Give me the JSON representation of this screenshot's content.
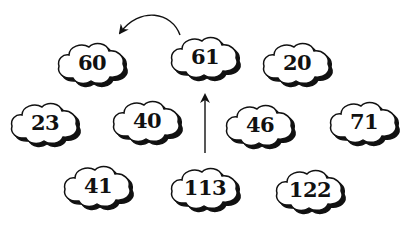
{
  "diagram": {
    "type": "number-clouds",
    "colors": {
      "background": "#ffffff",
      "outline": "#111111",
      "shadow": "#111111",
      "fill": "#ffffff",
      "text": "#111111"
    },
    "clouds": [
      {
        "id": "c60",
        "label": "60",
        "cx": 92,
        "cy": 63
      },
      {
        "id": "c61",
        "label": "61",
        "cx": 205,
        "cy": 57
      },
      {
        "id": "c20",
        "label": "20",
        "cx": 297,
        "cy": 63
      },
      {
        "id": "c23",
        "label": "23",
        "cx": 45,
        "cy": 123
      },
      {
        "id": "c40",
        "label": "40",
        "cx": 147,
        "cy": 121
      },
      {
        "id": "c46",
        "label": "46",
        "cx": 260,
        "cy": 125
      },
      {
        "id": "c71",
        "label": "71",
        "cx": 364,
        "cy": 122
      },
      {
        "id": "c41",
        "label": "41",
        "cx": 98,
        "cy": 186
      },
      {
        "id": "c113",
        "label": "113",
        "cx": 205,
        "cy": 188
      },
      {
        "id": "c122",
        "label": "122",
        "cx": 310,
        "cy": 190
      }
    ],
    "arrows": [
      {
        "id": "arrow-113-to-61",
        "from": "113",
        "to": "61",
        "shape": "straight-vertical"
      },
      {
        "id": "arrow-61-to-60",
        "from": "61",
        "to": "60",
        "shape": "curved-arc"
      }
    ]
  }
}
